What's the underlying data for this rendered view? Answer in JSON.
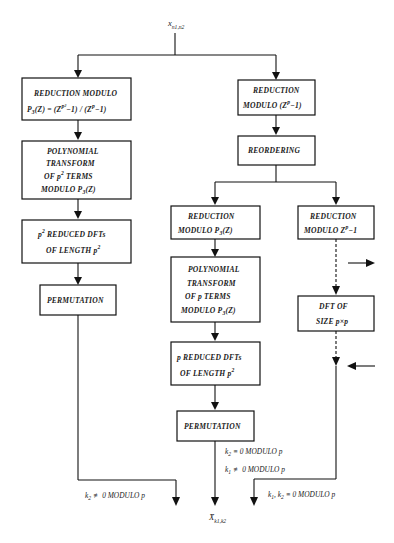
{
  "diagram": {
    "type": "flowchart",
    "input": {
      "symbol": "x",
      "subscript": "n1,n2"
    },
    "output": {
      "symbol": "X̄",
      "subscript": "k1,k2"
    },
    "boxes": {
      "red_mod_left": {
        "line1": "REDUCTION MODULO",
        "line2_a": "P",
        "line2_sub": "3",
        "line2_b": "(Z) = (Z",
        "line2_sup1": "p²",
        "line2_c": "−1) / (Z",
        "line2_sup2": "p",
        "line2_d": "−1)"
      },
      "poly_left": {
        "line1": "POLYNOMIAL",
        "line2": "TRANSFORM",
        "line3_a": "OF p",
        "line3_sup": "2",
        "line3_b": " TERMS",
        "line4_a": "MODULO  P",
        "line4_sub": "3",
        "line4_b": "(Z)"
      },
      "dfts_left": {
        "line1_a": "p",
        "line1_sup": "2",
        "line1_b": "  REDUCED  DFTs",
        "line2_a": "OF  LENGTH  p",
        "line2_sup": "2"
      },
      "perm_left": {
        "line1": "PERMUTATION"
      },
      "red_mod_right": {
        "line1": "REDUCTION",
        "line2_a": "MODULO  (Z",
        "line2_sup": "p",
        "line2_b": "−1)"
      },
      "reorder": {
        "line1": "REORDERING"
      },
      "red_p3_mid": {
        "line1": "REDUCTION",
        "line2_a": "MODULO  P",
        "line2_sub": "3",
        "line2_b": "(Z)"
      },
      "red_zp_right": {
        "line1": "REDUCTION",
        "line2_a": "MODULO  Z",
        "line2_sup": "p",
        "line2_b": "−1"
      },
      "poly_mid": {
        "line1": "POLYNOMIAL",
        "line2": "TRANSFORM",
        "line3": "OF  p  TERMS",
        "line4_a": "MODULO  P",
        "line4_sub": "3",
        "line4_b": "(Z)"
      },
      "dft_pxp": {
        "line1": "DFT  OF",
        "line2": "SIZE  p×p"
      },
      "dfts_mid": {
        "line1": "p  REDUCED  DFTs",
        "line2_a": "OF  LENGTH  p",
        "line2_sup": "2"
      },
      "perm_mid": {
        "line1": "PERMUTATION"
      }
    },
    "labels": {
      "left_out": {
        "a": "k",
        "sub": "2",
        "b": " ≢ 0  MODULO  p"
      },
      "mid_out1": {
        "a": "k",
        "sub": "2",
        "b": " ≡ 0  MODULO  p"
      },
      "mid_out2": {
        "a": "k",
        "sub": "1",
        "b": " ≢ 0  MODULO  p"
      },
      "right_out": {
        "a": "k",
        "sub1": "1",
        "b": ",  k",
        "sub2": "2",
        "c": " ≡ 0  MODULO  p"
      }
    }
  }
}
